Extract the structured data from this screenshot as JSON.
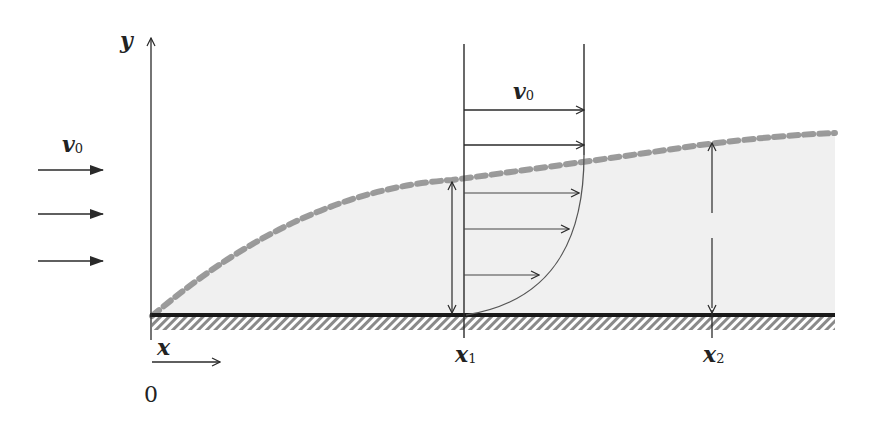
{
  "diagram": {
    "labels": {
      "y_axis": "y",
      "x_axis": "x",
      "origin": "0",
      "freestream_velocity_left": "v",
      "freestream_velocity_left_sub": "0",
      "freestream_velocity_top": "v",
      "freestream_velocity_top_sub": "0",
      "x1": "x",
      "x1_sub": "1",
      "x2": "x",
      "x2_sub": "2"
    },
    "colors": {
      "line": "#2a2a2a",
      "boundary_layer_fill": "#f0f0f0",
      "boundary_edge_dash": "#8a8a8a",
      "wall_hatch": "#8a8a8a",
      "wall": "#1a1a1a"
    },
    "elements": {
      "freestream_arrows_count": 3,
      "profile_arrows_uniform_count": 2,
      "profile_arrows_inside_layer_count": 3,
      "thickness_markers": [
        "x1",
        "x2"
      ]
    }
  }
}
